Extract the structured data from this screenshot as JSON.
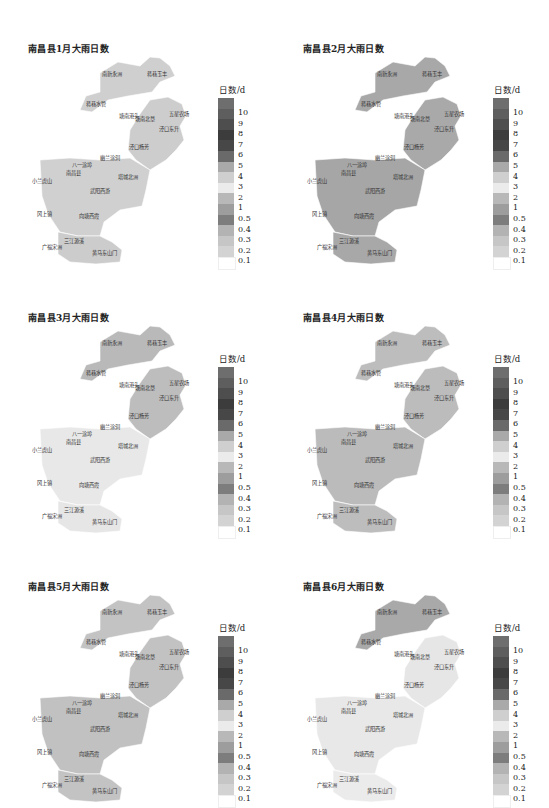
{
  "figure": {
    "panels": [
      {
        "title": "南昌县1月大雨日数",
        "month": "1月",
        "dominant_class": "0.1"
      },
      {
        "title": "南昌县2月大雨日数",
        "month": "2月",
        "dominant_class": "0.5"
      },
      {
        "title": "南昌县3月大雨日数",
        "month": "3月",
        "dominant_class": "0.3"
      },
      {
        "title": "南昌县4月大雨日数",
        "month": "4月",
        "dominant_class": "1"
      },
      {
        "title": "南昌县5月大雨日数",
        "month": "5月",
        "dominant_class": "1"
      },
      {
        "title": "南昌县6月大雨日数",
        "month": "6月",
        "dominant_class": "3"
      }
    ],
    "legend": {
      "title": "日数/d",
      "labels": [
        "10",
        "9",
        "8",
        "7",
        "6",
        "5",
        "4",
        "3",
        "2",
        "1",
        "0.5",
        "0.4",
        "0.3",
        "0.2",
        "0.1"
      ],
      "colors": [
        "#6e6e6e",
        "#5e5e5e",
        "#4e4e4e",
        "#3c3c3c",
        "#474747",
        "#6a6a6a",
        "#a9a9a9",
        "#cfcfcf",
        "#ebebeb",
        "#b8b8b8",
        "#9d9d9d",
        "#7d7d7d",
        "#b3b3b3",
        "#c6c6c6",
        "#d3d3d3",
        "#ffffff"
      ]
    },
    "stations": [
      {
        "name": "南新永洲",
        "x": 112,
        "y": 73
      },
      {
        "name": "蒋巷玉丰",
        "x": 157,
        "y": 73
      },
      {
        "name": "蒋巷水管",
        "x": 96,
        "y": 103
      },
      {
        "name": "塘南港头",
        "x": 129,
        "y": 115
      },
      {
        "name": "塘南北垦",
        "x": 145,
        "y": 118
      },
      {
        "name": "五星农场",
        "x": 179,
        "y": 113
      },
      {
        "name": "泾口东升",
        "x": 169,
        "y": 128
      },
      {
        "name": "泾口杨芳",
        "x": 139,
        "y": 146
      },
      {
        "name": "幽兰涂洞",
        "x": 110,
        "y": 157
      },
      {
        "name": "八一涂埠",
        "x": 82,
        "y": 164
      },
      {
        "name": "南昌县",
        "x": 76,
        "y": 172
      },
      {
        "name": "小兰虎山",
        "x": 42,
        "y": 180
      },
      {
        "name": "塔城北洲",
        "x": 128,
        "y": 176
      },
      {
        "name": "武阳西游",
        "x": 100,
        "y": 190
      },
      {
        "name": "冈上镇",
        "x": 47,
        "y": 213
      },
      {
        "name": "向塘西霞",
        "x": 89,
        "y": 215
      },
      {
        "name": "三江源溪",
        "x": 74,
        "y": 240
      },
      {
        "name": "广福宋洲",
        "x": 52,
        "y": 246
      },
      {
        "name": "黄马东山门",
        "x": 102,
        "y": 252
      }
    ]
  },
  "chart_data": [
    {
      "type": "heatmap",
      "title": "南昌县1月大雨日数",
      "legend_title": "日数/d",
      "classes": [
        "0.1",
        "0.2",
        "0.3",
        "0.4",
        "0.5",
        "1",
        "2",
        "3",
        "4",
        "5",
        "6",
        "7",
        "8",
        "9",
        "10"
      ],
      "regions": {
        "all": "0.1-0.2",
        "north_tip": "<0.1"
      }
    },
    {
      "type": "heatmap",
      "title": "南昌县2月大雨日数",
      "legend_title": "日数/d",
      "regions": {
        "most": "0.5-1",
        "南新永洲": "0.4-0.5",
        "幽兰涂洞": "2-3",
        "五星农场": "0.1-0.2",
        "广福宋洲": "0.2-0.3",
        "south_band": "0.4"
      }
    },
    {
      "type": "heatmap",
      "title": "南昌县3月大雨日数",
      "legend_title": "日数/d",
      "regions": {
        "north": "0.5",
        "蒋巷水管": "2-3",
        "central": "2-3",
        "east": "0.5",
        "south_west": "0.5",
        "南昌县": "0.4",
        "塔城北洲": "0.4"
      }
    },
    {
      "type": "heatmap",
      "title": "南昌县4月大雨日数",
      "legend_title": "日数/d",
      "regions": {
        "most": "0.5-1",
        "泾口东升": "2-3",
        "八一涂埠": "2-3",
        "向塘西霞": "0.4"
      }
    },
    {
      "type": "heatmap",
      "title": "南昌县5月大雨日数",
      "legend_title": "日数/d",
      "regions": {
        "most": "0.5-1",
        "泾口杨芳": "0.4",
        "向塘西霞": "2-3",
        "五星农场": "2-3"
      }
    },
    {
      "type": "heatmap",
      "title": "南昌县6月大雨日数",
      "legend_title": "日数/d",
      "regions": {
        "north": "0.5",
        "most": "2-3",
        "小兰虎山-冈上镇": "0.5"
      }
    }
  ]
}
